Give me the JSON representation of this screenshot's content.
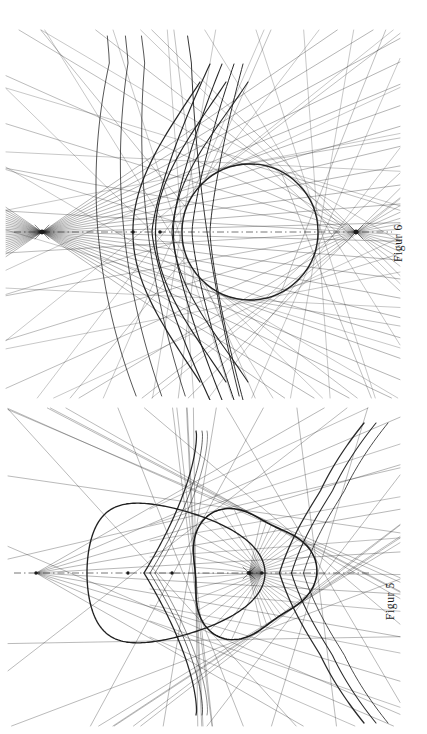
{
  "page": {
    "background_color": "#ffffff",
    "ink_color": "#1a1a1a",
    "orientation_note": "captions rotated 90 degrees counter-clockwise",
    "width": 427,
    "height": 734
  },
  "figures": [
    {
      "id": "figure-6",
      "caption": "Figur 6",
      "position": "top",
      "axis": {
        "style": "dash-dot",
        "orientation": "horizontal",
        "y": 232
      },
      "nodes": [
        {
          "name": "left-focus",
          "x": 42,
          "y": 232,
          "marker": "dot-with-cross"
        },
        {
          "name": "axis-point-a",
          "x": 133,
          "y": 232,
          "marker": "small-dot"
        },
        {
          "name": "axis-point-b",
          "x": 160,
          "y": 232,
          "marker": "small-dot"
        },
        {
          "name": "right-focus",
          "x": 356,
          "y": 232,
          "marker": "dot-with-cross"
        }
      ],
      "curves": {
        "main_circle": {
          "cx": 250,
          "cy": 232,
          "r": 68
        },
        "caustic_arcs": 4,
        "tangent_rays": 46,
        "vertical_generators": 4
      }
    },
    {
      "id": "figure-5",
      "caption": "Figur 5",
      "position": "bottom",
      "axis": {
        "style": "dash-dot",
        "orientation": "horizontal",
        "y": 573
      },
      "nodes": [
        {
          "name": "left-vertex",
          "x": 36,
          "y": 573,
          "marker": "small-dot"
        },
        {
          "name": "axis-point-c",
          "x": 128,
          "y": 573,
          "marker": "small-dot"
        },
        {
          "name": "axis-point-d",
          "x": 172,
          "y": 573,
          "marker": "small-dot"
        },
        {
          "name": "inner-focus",
          "x": 249,
          "y": 573,
          "marker": "dot-with-cross"
        },
        {
          "name": "inner-point-e",
          "x": 262,
          "y": 573,
          "marker": "small-dot"
        }
      ],
      "curves": {
        "outer_oval": {
          "cx": 150,
          "cy": 573,
          "rx": 115,
          "ry": 60
        },
        "inner_deltoid_like": {
          "cx": 248,
          "cy": 573,
          "r": 62
        },
        "tangent_rays": 44,
        "cusps": 2
      }
    }
  ],
  "captions": {
    "figur6": "Figur 6",
    "figur5": "Figur 5"
  }
}
